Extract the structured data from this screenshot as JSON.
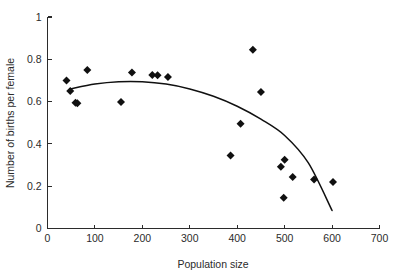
{
  "chart_data": {
    "type": "scatter",
    "title": "",
    "xlabel": "Population size",
    "ylabel": "Number of births per female",
    "xlim": [
      0,
      700
    ],
    "ylim": [
      0,
      1
    ],
    "xticks": [
      0,
      100,
      200,
      300,
      400,
      500,
      600,
      700
    ],
    "yticks": [
      0,
      0.2,
      0.4,
      0.6,
      0.8,
      1
    ],
    "xtick_labels": [
      "0",
      "100",
      "200",
      "300",
      "400",
      "500",
      "600",
      "700"
    ],
    "ytick_labels": [
      "0",
      "0.2",
      "0.4",
      "0.6",
      "0.8",
      "1"
    ],
    "grid": false,
    "legend": null,
    "marker": "diamond",
    "marker_color": "#101010",
    "points": [
      {
        "x": 40,
        "y": 0.7
      },
      {
        "x": 48,
        "y": 0.65
      },
      {
        "x": 59,
        "y": 0.595
      },
      {
        "x": 63,
        "y": 0.592
      },
      {
        "x": 84,
        "y": 0.75
      },
      {
        "x": 155,
        "y": 0.598
      },
      {
        "x": 178,
        "y": 0.738
      },
      {
        "x": 221,
        "y": 0.726
      },
      {
        "x": 232,
        "y": 0.724
      },
      {
        "x": 254,
        "y": 0.716
      },
      {
        "x": 386,
        "y": 0.345
      },
      {
        "x": 407,
        "y": 0.495
      },
      {
        "x": 433,
        "y": 0.845
      },
      {
        "x": 450,
        "y": 0.645
      },
      {
        "x": 492,
        "y": 0.292
      },
      {
        "x": 500,
        "y": 0.325
      },
      {
        "x": 498,
        "y": 0.145
      },
      {
        "x": 517,
        "y": 0.243
      },
      {
        "x": 562,
        "y": 0.232
      },
      {
        "x": 602,
        "y": 0.22
      }
    ],
    "fit_curve": {
      "name": "quadratic-fit",
      "color": "#101010",
      "x": [
        47,
        100,
        150,
        200,
        250,
        300,
        350,
        400,
        450,
        500,
        550,
        600
      ],
      "y": [
        0.66,
        0.683,
        0.694,
        0.694,
        0.683,
        0.66,
        0.625,
        0.578,
        0.517,
        0.44,
        0.31,
        0.085
      ]
    }
  },
  "axes": {
    "x_axis_name": "x-axis",
    "y_axis_name": "y-axis"
  }
}
